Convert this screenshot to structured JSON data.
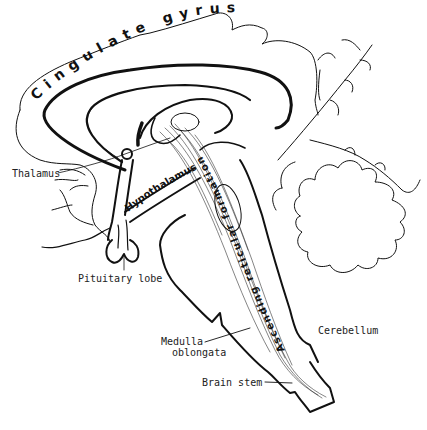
{
  "diagram": {
    "labels": {
      "cingulate_gyrus": "Cingulate gyrus",
      "thalamus": "Thalamus",
      "hypothalamus": "Hypothalamus",
      "reticular_formation": "Ascending reticular formation",
      "reticular_formation_part1": "Ascending",
      "reticular_formation_part2": "reticular",
      "reticular_formation_part3": "formation",
      "pituitary_lobe": "Pituitary lobe",
      "cerebellum": "Cerebellum",
      "medulla_line1": "Medulla",
      "medulla_line2": "oblongata",
      "brain_stem": "Brain stem"
    },
    "colors": {
      "line": "#111111",
      "background": "#ffffff",
      "text": "#222222"
    }
  }
}
